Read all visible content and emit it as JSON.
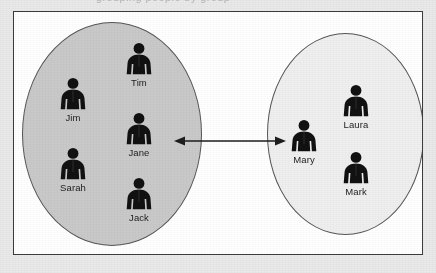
{
  "page": {
    "clipped_caption": "grouping people by group",
    "background_color": "#e9e9e9",
    "frame_color": "#ffffff",
    "frame_border_color": "#3b3b3b"
  },
  "diagram": {
    "type": "venn-style grouping diagram",
    "relationship_arrow": {
      "name": "bidirectional-arrow",
      "direction": "both",
      "from_group": "left",
      "to_group": "right",
      "color": "#1d1d1d"
    },
    "groups": [
      {
        "id": "left",
        "fill_color": "#c9c9c9",
        "border_color": "#555555",
        "members": [
          {
            "name": "Tim",
            "icon": "person-icon"
          },
          {
            "name": "Jim",
            "icon": "person-icon"
          },
          {
            "name": "Jane",
            "icon": "person-icon"
          },
          {
            "name": "Sarah",
            "icon": "person-icon"
          },
          {
            "name": "Jack",
            "icon": "person-icon"
          }
        ]
      },
      {
        "id": "right",
        "fill_color": "#efefef",
        "border_color": "#555555",
        "members": [
          {
            "name": "Mary",
            "icon": "person-icon"
          },
          {
            "name": "Laura",
            "icon": "person-icon"
          },
          {
            "name": "Mark",
            "icon": "person-icon"
          }
        ]
      }
    ]
  }
}
